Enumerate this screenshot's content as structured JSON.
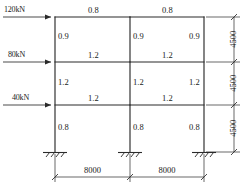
{
  "diagram": {
    "line_color": "#2a2a2a",
    "text_color": "#1a1a1a",
    "loads": [
      {
        "id": "load-top",
        "label": "120kN",
        "level": "roof"
      },
      {
        "id": "load-middle",
        "label": "80kN",
        "level": "floor-3"
      },
      {
        "id": "load-lower",
        "label": "40kN",
        "level": "floor-2"
      }
    ],
    "beam_stiffness": {
      "roof": [
        "0.8",
        "0.8"
      ],
      "floor_3": [
        "1.2",
        "1.2"
      ],
      "floor_2": [
        "1.2",
        "1.2"
      ]
    },
    "column_stiffness": {
      "storey_3": [
        "0.9",
        "0.9",
        "0.9"
      ],
      "storey_2": [
        "1.2",
        "1.2",
        "1.2"
      ],
      "storey_1": [
        "0.8",
        "0.8",
        "0.8"
      ]
    },
    "vertical_dimensions": [
      "4500",
      "4500",
      "4500"
    ],
    "horizontal_dimensions": [
      "8000",
      "8000"
    ],
    "supports": [
      "fixed",
      "fixed",
      "fixed"
    ]
  }
}
